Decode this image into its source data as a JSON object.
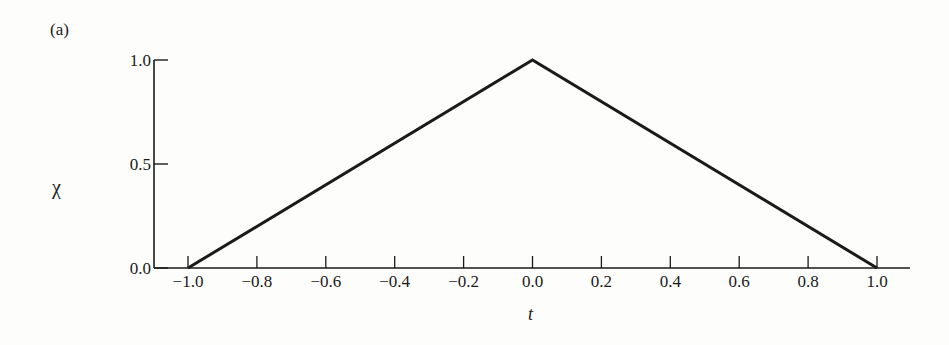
{
  "panel_label": "(a)",
  "chart_data": {
    "type": "line",
    "title": "",
    "xlabel": "t",
    "ylabel": "χ",
    "xlim": [
      -1.0,
      1.1
    ],
    "ylim": [
      0.0,
      1.0
    ],
    "grid": false,
    "legend": null,
    "x_ticks": [
      -1.0,
      -0.8,
      -0.6,
      -0.4,
      -0.2,
      0.0,
      0.2,
      0.4,
      0.6,
      0.8,
      1.0
    ],
    "x_tick_labels": [
      "−1.0",
      "−0.8",
      "−0.6",
      "−0.4",
      "−0.2",
      "0.0",
      "0.2",
      "0.4",
      "0.6",
      "0.8",
      "1.0"
    ],
    "y_ticks": [
      0.0,
      0.5,
      1.0
    ],
    "y_tick_labels": [
      "0.0",
      "0.5",
      "1.0"
    ],
    "series": [
      {
        "name": "χ(t)",
        "x": [
          -1.0,
          0.0,
          1.0
        ],
        "y": [
          0.0,
          1.0,
          0.0
        ],
        "color": "#1a1a1a"
      }
    ]
  }
}
